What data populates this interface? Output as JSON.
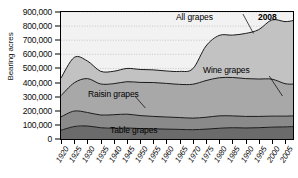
{
  "chart_data": {
    "type": "area",
    "title": "",
    "subtitle": "",
    "xlabel": "",
    "ylabel": "Bearing acres",
    "stacked": true,
    "grid": "horizontal-dotted",
    "legend_position": "inline-annotations",
    "xlim": [
      1920,
      2008
    ],
    "ylim": [
      0,
      900000
    ],
    "ytick_values": [
      0,
      100000,
      200000,
      300000,
      400000,
      500000,
      600000,
      700000,
      800000,
      900000
    ],
    "ytick_labels": [
      "0",
      "100,000",
      "200,000",
      "300,000",
      "400,000",
      "500,000",
      "600,000",
      "700,000",
      "800,000",
      "900,000"
    ],
    "xtick_values": [
      1920,
      1925,
      1930,
      1935,
      1940,
      1945,
      1950,
      1955,
      1960,
      1965,
      1970,
      1975,
      1980,
      1985,
      1990,
      1995,
      2000,
      2005
    ],
    "xtick_labels": [
      "1920",
      "1925",
      "1930",
      "1935",
      "1940",
      "1945",
      "1950",
      "1955",
      "1960",
      "1965",
      "1970",
      "1975",
      "1980",
      "1985",
      "1990",
      "1995",
      "2000",
      "2005"
    ],
    "annotations": [
      {
        "text": "All grapes",
        "note": "label for top boundary of stack (total)"
      },
      {
        "text": "2008",
        "note": "last year of data, top right corner"
      },
      {
        "text": "Wine grapes",
        "note": "label for top band"
      },
      {
        "text": "Raisin grapes",
        "note": "label for third band from bottom"
      },
      {
        "text": "Table grapes",
        "note": "label for bottom band"
      }
    ],
    "x": [
      1920,
      1925,
      1930,
      1935,
      1940,
      1945,
      1950,
      1955,
      1960,
      1965,
      1970,
      1975,
      1980,
      1985,
      1990,
      1995,
      2000,
      2005,
      2008
    ],
    "series": [
      {
        "name": "Table grapes",
        "color": "#6b6b6b",
        "values": [
          62000,
          88000,
          92000,
          80000,
          76000,
          78000,
          74000,
          72000,
          70000,
          68000,
          66000,
          70000,
          76000,
          80000,
          78000,
          80000,
          84000,
          86000,
          88000
        ]
      },
      {
        "name": "Other grapes",
        "color": "#8a8a8a",
        "values": [
          95000,
          110000,
          96000,
          90000,
          96000,
          98000,
          92000,
          88000,
          86000,
          84000,
          82000,
          84000,
          88000,
          84000,
          82000,
          80000,
          78000,
          76000,
          76000
        ]
      },
      {
        "name": "Raisin grapes",
        "color": "#a8a8a8",
        "values": [
          150000,
          200000,
          240000,
          220000,
          220000,
          230000,
          235000,
          240000,
          238000,
          235000,
          240000,
          260000,
          270000,
          272000,
          268000,
          265000,
          262000,
          230000,
          225000
        ]
      },
      {
        "name": "Wine grapes",
        "color": "#c2c2c2",
        "values": [
          125000,
          180000,
          125000,
          90000,
          88000,
          94000,
          92000,
          90000,
          88000,
          92000,
          110000,
          245000,
          300000,
          300000,
          320000,
          350000,
          420000,
          440000,
          450000
        ]
      }
    ],
    "total_series": {
      "name": "All grapes",
      "values": [
        432000,
        578000,
        553000,
        480000,
        480000,
        500000,
        493000,
        490000,
        482000,
        479000,
        498000,
        659000,
        734000,
        736000,
        748000,
        775000,
        844000,
        832000,
        839000
      ]
    },
    "colors": {
      "plot_background": "#f2f2f2",
      "axis": "#000000",
      "gridline": "#bdbdbd",
      "band_wine": "#c2c2c2",
      "band_raisin": "#a8a8a8",
      "band_other": "#8a8a8a",
      "band_table": "#6b6b6b"
    }
  }
}
